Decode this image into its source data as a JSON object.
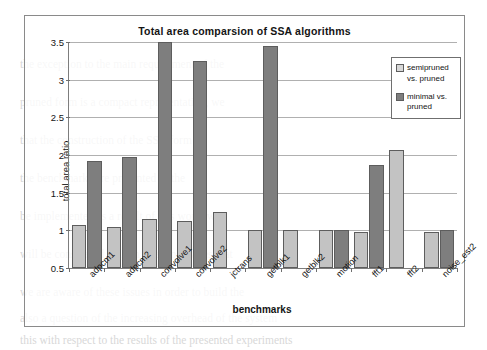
{
  "chart_data": {
    "type": "bar",
    "title": "Total area comparsion of SSA algorithms",
    "xlabel": "benchmarks",
    "ylabel": "total area ratio",
    "ylim": [
      0.5,
      3.5
    ],
    "yticks": [
      "0.5",
      "1",
      "1.5",
      "2",
      "2.5",
      "3",
      "3.5"
    ],
    "ytick_values": [
      0.5,
      1,
      1.5,
      2,
      2.5,
      3,
      3.5
    ],
    "grid": true,
    "legend_position": "top-right",
    "categories": [
      "adpcm1",
      "adpcm2",
      "convolve1",
      "convolve2",
      "jctrans",
      "getblk1",
      "getblk2",
      "motion",
      "fft1",
      "fft2",
      "noise_est2"
    ],
    "series": [
      {
        "name": "semipruned vs. pruned",
        "color": "#c3c3c3",
        "values": [
          1.07,
          1.05,
          1.15,
          1.13,
          1.25,
          1.0,
          1.01,
          1.0,
          0.98,
          2.06,
          0.98
        ]
      },
      {
        "name": "minimal vs. pruned",
        "color": "#7e7e7e",
        "values": [
          1.92,
          1.98,
          3.5,
          3.25,
          null,
          3.45,
          null,
          1.0,
          1.87,
          null,
          1.0
        ]
      }
    ]
  },
  "legend": {
    "items": [
      {
        "label_line1": "semipruned",
        "label_line2": "vs. pruned",
        "swatch": "semipruned-swatch"
      },
      {
        "label_line1": "minimal vs.",
        "label_line2": "pruned",
        "swatch": "minimal-swatch"
      }
    ]
  },
  "background_text": {
    "lines": [
      "the exception to the main requirement of the",
      "pruned form is a compact representation, we",
      "that the construction of the SSA form in",
      "the benchmarks are presented in the",
      "be implemented as a result of this work, we",
      "will be considered only in a few packages that",
      "we are aware of these issues in order to build the",
      "also a question of the increasing overhead of the system",
      "this with respect to the results of the presented experiments"
    ]
  }
}
